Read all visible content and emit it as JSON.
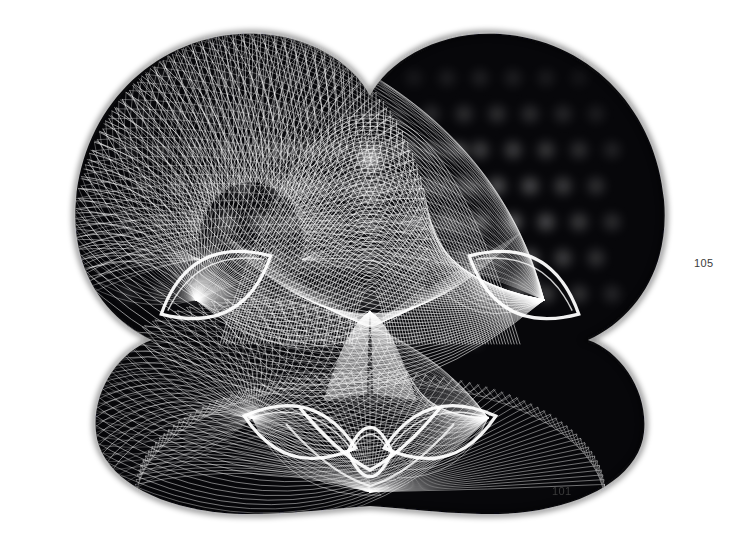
{
  "page": {
    "width": 738,
    "height": 539,
    "background_color": "#ffffff",
    "ink_color": "#000000",
    "line_color": "#ffffff"
  },
  "artwork": {
    "title": "Harmonograph string-art plate",
    "description": "Symmetric black-and-white moire caustic figure formed by dense families of white curves on a black ground, resembling a butterfly or owl mask.",
    "style": "string-art / harmonograph envelope",
    "symmetry": "bilateral, vertical mirror axis at x = 370"
  },
  "labels": [
    {
      "name": "figure-number-105",
      "text": "105",
      "x": 694,
      "y": 257
    },
    {
      "name": "figure-number-101",
      "text": "101",
      "x": 552,
      "y": 485
    }
  ],
  "chart_data": {
    "type": "scatter",
    "xlabel": "",
    "ylabel": "",
    "xlim": [
      0,
      738
    ],
    "ylim": [
      0,
      539
    ],
    "grid": false,
    "legend": "none",
    "axis_visible": false,
    "mirror_axis_x": 370,
    "curve_families": [
      {
        "name": "upper-left-wing-fan",
        "focus": [
          196,
          300
        ],
        "arc_center": [
          250,
          250
        ],
        "radius_x": 172,
        "radius_y": 210,
        "count": 62,
        "angle_start": 170,
        "angle_end": 372,
        "stroke_width": 0.7
      },
      {
        "name": "upper-right-wing-fan",
        "focus": [
          544,
          300
        ],
        "arc_center": [
          490,
          250
        ],
        "radius_x": 172,
        "radius_y": 210,
        "count": 62,
        "angle_start": 168,
        "angle_end": 370,
        "stroke_width": 0.7
      },
      {
        "name": "upper-left-cross-fan",
        "focus": [
          196,
          300
        ],
        "count": 62,
        "stroke_width": 0.7
      },
      {
        "name": "upper-right-cross-fan",
        "focus": [
          544,
          300
        ],
        "count": 62,
        "stroke_width": 0.7
      },
      {
        "name": "central-dome-arches",
        "center": [
          370,
          330
        ],
        "radius_x": 150,
        "radius_y": 215,
        "count": 46,
        "stroke_width": 0.7
      },
      {
        "name": "lower-left-lobe-fan",
        "focus": [
          250,
          440
        ],
        "radius_x": 150,
        "radius_y": 118,
        "count": 58,
        "stroke_width": 0.65
      },
      {
        "name": "lower-right-lobe-fan",
        "focus": [
          490,
          440
        ],
        "radius_x": 150,
        "radius_y": 118,
        "count": 58,
        "stroke_width": 0.65
      },
      {
        "name": "bottom-skirt-fan",
        "focus": [
          370,
          492
        ],
        "radius_x": 235,
        "radius_y": 105,
        "count": 76,
        "stroke_width": 0.65
      },
      {
        "name": "central-teardrop",
        "apex": [
          370,
          312
        ],
        "base_y": 400,
        "half_width": 46,
        "count": 40,
        "stroke_width": 0.55
      }
    ],
    "caustics": [
      {
        "name": "left-eye-lens",
        "center": [
          216,
          285
        ],
        "rx": 62,
        "ry": 30,
        "rotation": -28
      },
      {
        "name": "right-eye-lens",
        "center": [
          524,
          285
        ],
        "rx": 62,
        "ry": 30,
        "rotation": 28
      },
      {
        "name": "left-heart-lobe",
        "center": [
          300,
          432
        ],
        "rx": 58,
        "ry": 26,
        "rotation": 16
      },
      {
        "name": "right-heart-lobe",
        "center": [
          440,
          432
        ],
        "rx": 58,
        "ry": 26,
        "rotation": -16
      },
      {
        "name": "central-cusp",
        "center": [
          370,
          452
        ],
        "rx": 22,
        "ry": 26,
        "rotation": 0
      }
    ],
    "bright_nodes_note": "Moire interference blobs appear at the intersections of crossing curve families, brightest in the upper wing interiors and the central dome."
  }
}
